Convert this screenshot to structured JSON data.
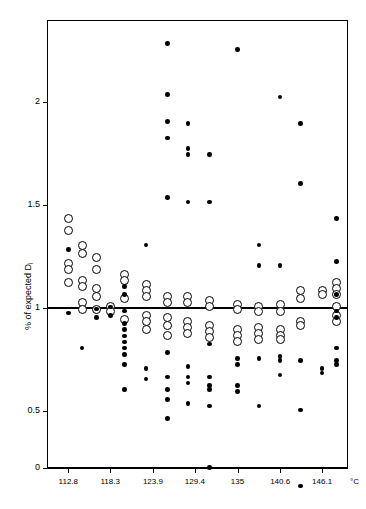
{
  "chart_data": {
    "type": "scatter",
    "title": "",
    "xlabel": "",
    "ylabel": "% of expected D",
    "ylabel_sub": "i",
    "xunit": "°C",
    "xlim": [
      110.0,
      149.5
    ],
    "ylim": [
      0,
      2.45
    ],
    "yticks": [
      0,
      0.5,
      1,
      1.5,
      2
    ],
    "ytick_labels": [
      "0",
      "0.5",
      "1",
      "1.5",
      "2"
    ],
    "xticks": [
      112.8,
      118.3,
      123.9,
      129.4,
      135,
      140.6,
      146.1
    ],
    "xtick_labels": [
      "112.8",
      "118.3",
      "123.9",
      "129.4",
      "135",
      "140.6",
      "146.1"
    ],
    "grid": false,
    "legend": "none",
    "reference_line": {
      "y": 1.0,
      "style": "solid",
      "color": "#000000"
    },
    "series": [
      {
        "name": "open-circles",
        "marker": "open-circle",
        "color": "#000000",
        "points": [
          [
            112.8,
            1.435
          ],
          [
            112.8,
            1.375
          ],
          [
            112.8,
            1.215
          ],
          [
            112.8,
            1.185
          ],
          [
            112.8,
            1.125
          ],
          [
            114.6,
            1.305
          ],
          [
            114.6,
            1.265
          ],
          [
            114.6,
            1.135
          ],
          [
            114.6,
            1.105
          ],
          [
            114.6,
            1.025
          ],
          [
            114.6,
            0.995
          ],
          [
            116.5,
            1.245
          ],
          [
            116.5,
            1.185
          ],
          [
            116.5,
            1.095
          ],
          [
            116.5,
            1.055
          ],
          [
            116.5,
            0.995
          ],
          [
            118.3,
            1.005
          ],
          [
            118.3,
            0.985
          ],
          [
            120.2,
            1.165
          ],
          [
            120.2,
            1.135
          ],
          [
            120.2,
            1.045
          ],
          [
            120.2,
            0.945
          ],
          [
            123.0,
            1.115
          ],
          [
            123.0,
            1.085
          ],
          [
            123.0,
            1.055
          ],
          [
            123.0,
            0.965
          ],
          [
            123.0,
            0.935
          ],
          [
            123.0,
            0.895
          ],
          [
            125.8,
            1.055
          ],
          [
            125.8,
            1.025
          ],
          [
            125.8,
            0.955
          ],
          [
            125.8,
            0.915
          ],
          [
            125.8,
            0.865
          ],
          [
            128.5,
            1.055
          ],
          [
            128.5,
            1.025
          ],
          [
            128.5,
            0.935
          ],
          [
            128.5,
            0.905
          ],
          [
            128.5,
            0.875
          ],
          [
            131.3,
            1.035
          ],
          [
            131.3,
            1.005
          ],
          [
            131.3,
            0.915
          ],
          [
            131.3,
            0.885
          ],
          [
            131.3,
            0.855
          ],
          [
            135.0,
            1.015
          ],
          [
            135.0,
            0.995
          ],
          [
            135.0,
            0.895
          ],
          [
            135.0,
            0.865
          ],
          [
            135.0,
            0.835
          ],
          [
            137.8,
            1.005
          ],
          [
            137.8,
            0.985
          ],
          [
            137.8,
            0.905
          ],
          [
            137.8,
            0.875
          ],
          [
            137.8,
            0.845
          ],
          [
            140.6,
            1.015
          ],
          [
            140.6,
            0.985
          ],
          [
            140.6,
            0.895
          ],
          [
            140.6,
            0.865
          ],
          [
            140.6,
            0.845
          ],
          [
            143.3,
            1.085
          ],
          [
            143.3,
            1.045
          ],
          [
            143.3,
            0.935
          ],
          [
            143.3,
            0.915
          ],
          [
            146.1,
            1.085
          ],
          [
            146.1,
            1.065
          ],
          [
            148.0,
            1.125
          ],
          [
            148.0,
            1.095
          ],
          [
            148.0,
            1.065
          ],
          [
            148.0,
            1.005
          ],
          [
            148.0,
            0.965
          ],
          [
            148.0,
            0.935
          ]
        ]
      },
      {
        "name": "filled-dots",
        "marker": "filled-dot",
        "color": "#000000",
        "points": [
          [
            112.8,
            1.285
          ],
          [
            112.8,
            0.975
          ],
          [
            114.6,
            0.805
          ],
          [
            116.5,
            0.995
          ],
          [
            116.5,
            0.955
          ],
          [
            118.3,
            1.005
          ],
          [
            118.3,
            0.965
          ],
          [
            120.2,
            1.105
          ],
          [
            120.2,
            1.065
          ],
          [
            120.2,
            0.985
          ],
          [
            120.2,
            0.925
          ],
          [
            120.2,
            0.895
          ],
          [
            120.2,
            0.865
          ],
          [
            120.2,
            0.835
          ],
          [
            120.2,
            0.805
          ],
          [
            120.2,
            0.775
          ],
          [
            120.2,
            0.725
          ],
          [
            120.2,
            0.605
          ],
          [
            123.0,
            1.305
          ],
          [
            123.0,
            0.705
          ],
          [
            123.0,
            0.655
          ],
          [
            125.8,
            2.285
          ],
          [
            125.8,
            2.035
          ],
          [
            125.8,
            1.905
          ],
          [
            125.8,
            1.825
          ],
          [
            125.8,
            1.535
          ],
          [
            125.8,
            0.785
          ],
          [
            125.8,
            0.665
          ],
          [
            125.8,
            0.605
          ],
          [
            125.8,
            0.555
          ],
          [
            125.8,
            0.465
          ],
          [
            128.5,
            1.895
          ],
          [
            128.5,
            1.775
          ],
          [
            128.5,
            1.745
          ],
          [
            128.5,
            1.515
          ],
          [
            128.5,
            0.715
          ],
          [
            128.5,
            0.665
          ],
          [
            128.5,
            0.635
          ],
          [
            128.5,
            0.535
          ],
          [
            131.3,
            1.745
          ],
          [
            131.3,
            1.515
          ],
          [
            131.3,
            0.825
          ],
          [
            131.3,
            0.665
          ],
          [
            131.3,
            0.625
          ],
          [
            131.3,
            0.605
          ],
          [
            131.3,
            0.525
          ],
          [
            131.3,
            0.225
          ],
          [
            135.0,
            2.255
          ],
          [
            135.0,
            0.755
          ],
          [
            135.0,
            0.725
          ],
          [
            135.0,
            0.625
          ],
          [
            135.0,
            0.595
          ],
          [
            137.8,
            1.305
          ],
          [
            137.8,
            1.205
          ],
          [
            137.8,
            0.755
          ],
          [
            137.8,
            0.525
          ],
          [
            140.6,
            2.025
          ],
          [
            140.6,
            1.205
          ],
          [
            140.6,
            0.765
          ],
          [
            140.6,
            0.745
          ],
          [
            140.6,
            0.675
          ],
          [
            143.3,
            1.895
          ],
          [
            143.3,
            1.605
          ],
          [
            143.3,
            0.745
          ],
          [
            143.3,
            0.505
          ],
          [
            143.3,
            0.135
          ],
          [
            146.1,
            0.705
          ],
          [
            146.1,
            0.685
          ],
          [
            148.0,
            1.435
          ],
          [
            148.0,
            1.225
          ],
          [
            148.0,
            1.065
          ],
          [
            148.0,
            0.985
          ],
          [
            148.0,
            0.955
          ],
          [
            148.0,
            0.805
          ],
          [
            148.0,
            0.745
          ],
          [
            148.0,
            0.725
          ]
        ]
      }
    ]
  },
  "axes": {
    "y_title": "% of expected D",
    "y_title_sub": "i",
    "x_unit": "°C"
  }
}
